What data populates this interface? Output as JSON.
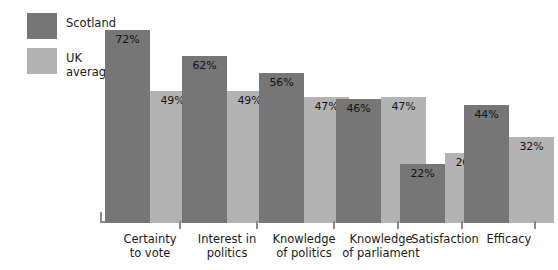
{
  "legend": {
    "items": [
      {
        "label": "Scotland",
        "color": "#767676",
        "name": "legend-scotland"
      },
      {
        "label": "UK\naverage",
        "color": "#b3b3b3",
        "name": "legend-uk-average"
      }
    ]
  },
  "chart_data": {
    "type": "bar",
    "title": "",
    "xlabel": "",
    "ylabel": "",
    "ylim": [
      0,
      80
    ],
    "grid": false,
    "legend_position": "top-left",
    "value_suffix": "%",
    "categories": [
      "Certainty\nto vote",
      "Interest in\npolitics",
      "Knowledge\nof politics",
      "Knowledge\nof parliament",
      "Satisfaction",
      "Efficacy"
    ],
    "series": [
      {
        "name": "Scotland",
        "color": "#767676",
        "values": [
          72,
          62,
          56,
          46,
          22,
          44
        ],
        "labels": [
          "72%",
          "62%",
          "56%",
          "46%",
          "22%",
          "44%"
        ]
      },
      {
        "name": "UK average",
        "color": "#b3b3b3",
        "values": [
          49,
          49,
          47,
          47,
          26,
          32
        ],
        "labels": [
          "49%",
          "49%",
          "47%",
          "47%",
          "26%",
          "32%"
        ]
      }
    ]
  }
}
